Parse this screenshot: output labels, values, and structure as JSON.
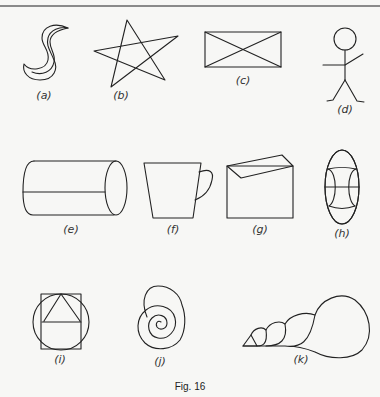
{
  "figure": {
    "caption": "Fig. 16",
    "items": [
      {
        "id": "a",
        "label": "(a)",
        "shape": "crescent-s-shape"
      },
      {
        "id": "b",
        "label": "(b)",
        "shape": "five-point-star"
      },
      {
        "id": "c",
        "label": "(c)",
        "shape": "rectangle-with-diagonals"
      },
      {
        "id": "d",
        "label": "(d)",
        "shape": "stick-figure"
      },
      {
        "id": "e",
        "label": "(e)",
        "shape": "cylinder"
      },
      {
        "id": "f",
        "label": "(f)",
        "shape": "cup"
      },
      {
        "id": "g",
        "label": "(g)",
        "shape": "envelope"
      },
      {
        "id": "h",
        "label": "(h)",
        "shape": "oval-with-curved-lines"
      },
      {
        "id": "i",
        "label": "(i)",
        "shape": "circle-square-triangle"
      },
      {
        "id": "j",
        "label": "(j)",
        "shape": "spiral-snail-shell"
      },
      {
        "id": "k",
        "label": "(k)",
        "shape": "conical-shell"
      }
    ]
  }
}
